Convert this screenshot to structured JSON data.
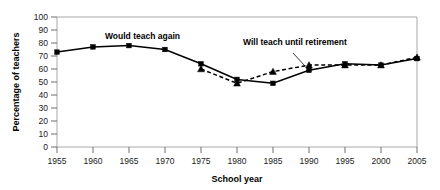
{
  "chart_data": {
    "type": "line",
    "title": "",
    "xlabel": "School year",
    "ylabel": "Percentage of teachers",
    "x": [
      1955,
      1960,
      1965,
      1970,
      1975,
      1980,
      1985,
      1990,
      1995,
      2000,
      2005
    ],
    "xtick_labels": [
      "1955",
      "1960",
      "1965",
      "1970",
      "1975",
      "1980",
      "1985",
      "1990",
      "1995",
      "2000",
      "2005"
    ],
    "ytick_labels": [
      "0",
      "10",
      "20",
      "30",
      "40",
      "50",
      "60",
      "70",
      "80",
      "90",
      "100"
    ],
    "ylim": [
      0,
      100
    ],
    "xlim": [
      1955,
      2005
    ],
    "grid": false,
    "legend_position": "inline-annotations",
    "series": [
      {
        "name": "Would teach again",
        "marker": "square",
        "linestyle": "solid",
        "color": "#000000",
        "x": [
          1955,
          1960,
          1965,
          1970,
          1975,
          1980,
          1985,
          1990,
          1995,
          2000,
          2005
        ],
        "values": [
          73,
          77,
          78,
          75,
          64,
          52,
          49,
          59,
          64,
          63,
          68
        ]
      },
      {
        "name": "Will teach until retirement",
        "marker": "triangle",
        "linestyle": "dashed",
        "color": "#000000",
        "x": [
          1975,
          1980,
          1985,
          1990,
          1995,
          2000,
          2005
        ],
        "values": [
          60,
          49,
          58,
          63,
          63,
          63,
          69
        ]
      }
    ],
    "annotations": [
      {
        "text": "Would teach again",
        "x": 1965,
        "y": 90
      },
      {
        "text": "Will teach until retirement",
        "x": 1988,
        "y": 82
      }
    ]
  },
  "axis": {
    "y_title": "Percentage of teachers",
    "x_title": "School year"
  },
  "labels": {
    "series_one": "Would teach again",
    "series_two": "Will teach until retirement"
  },
  "colors": {
    "ink": "#000000",
    "frame": "#a8a8a8",
    "background": "#ffffff"
  }
}
